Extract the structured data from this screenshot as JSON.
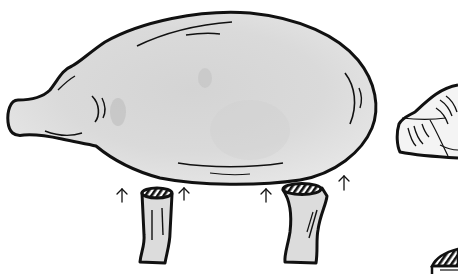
{
  "illustration": {
    "subject": "balloon pig body with detached sock-like legs",
    "colors": {
      "background": "#ffffff",
      "outline": "#111111",
      "body_fill": "#d9d9d9",
      "body_shade": "#c4c4c4",
      "leg_fill": "#dcdcdc",
      "hatch": "#111111"
    },
    "parts": {
      "body": "balloon-body",
      "legs": [
        "left-leg",
        "right-leg"
      ],
      "arrows_count": 4,
      "right_fragments": [
        "snout-fragment",
        "leg-top-fragment"
      ]
    }
  }
}
